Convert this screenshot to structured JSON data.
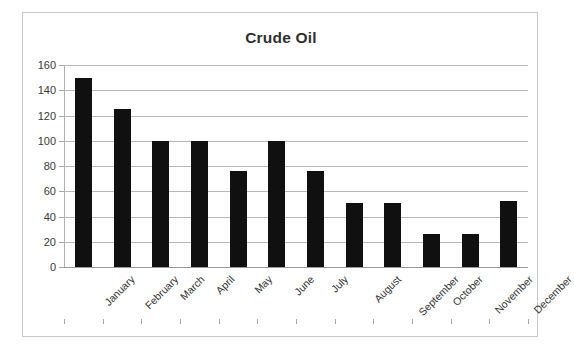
{
  "chart_data": {
    "type": "bar",
    "title": "Crude Oil",
    "xlabel": "",
    "ylabel": "",
    "categories": [
      "January",
      "February",
      "March",
      "April",
      "May",
      "June",
      "July",
      "August",
      "September",
      "October",
      "November",
      "December"
    ],
    "values": [
      150,
      125,
      100,
      100,
      76,
      100,
      76,
      51,
      51,
      26,
      26,
      52
    ],
    "ylim": [
      0,
      160
    ],
    "yticks": [
      0,
      20,
      40,
      60,
      80,
      100,
      120,
      140,
      160
    ],
    "ytick_labels": [
      "0",
      "20",
      "40",
      "60",
      "80",
      "100",
      "120",
      "140",
      "160"
    ],
    "grid": true,
    "legend": false,
    "bar_color": "#101010",
    "gridline_color": "#b8b8b8",
    "border_color": "#c9c9c9",
    "title_color": "#2f2f2f",
    "tick_label_rotation": -45
  }
}
